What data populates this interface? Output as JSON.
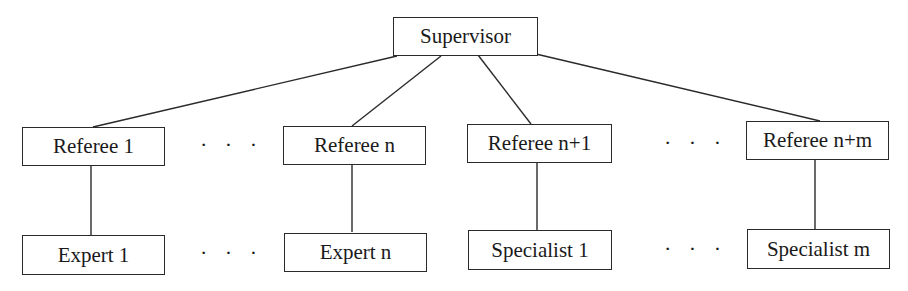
{
  "diagram": {
    "type": "hierarchy-tree",
    "root": {
      "label": "Supervisor"
    },
    "referees": [
      {
        "label": "Referee 1"
      },
      {
        "label": "Referee n"
      },
      {
        "label": "Referee n+1"
      },
      {
        "label": "Referee n+m"
      }
    ],
    "leaves": [
      {
        "label": "Expert 1"
      },
      {
        "label": "Expert n"
      },
      {
        "label": "Specialist 1"
      },
      {
        "label": "Specialist m"
      }
    ],
    "ellipsis": "· · ·",
    "line_color": "#2a2a2a"
  }
}
